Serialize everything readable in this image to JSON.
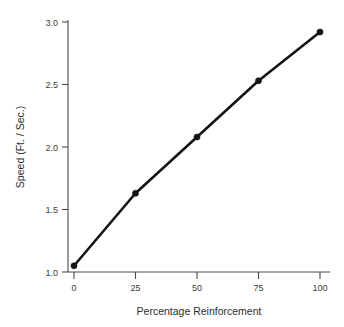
{
  "chart_data": {
    "type": "line",
    "title": "",
    "xlabel": "Percentage Reinforcement",
    "ylabel": "Speed (Ft. / Sec.)",
    "x": [
      0,
      25,
      50,
      75,
      100
    ],
    "values": [
      1.05,
      1.63,
      2.08,
      2.53,
      2.92
    ],
    "series": [
      {
        "name": "Speed",
        "x": [
          0,
          25,
          50,
          75,
          100
        ],
        "values": [
          1.05,
          1.63,
          2.08,
          2.53,
          2.92
        ]
      }
    ],
    "xlim": [
      -4,
      104
    ],
    "ylim": [
      1.0,
      3.0
    ],
    "xticks": [
      0,
      25,
      50,
      75,
      100
    ],
    "xtick_labels": [
      "0",
      "25",
      "50",
      "75",
      "100"
    ],
    "yticks": [
      1.0,
      1.5,
      2.0,
      2.5,
      3.0
    ],
    "ytick_labels": [
      "1.0",
      "1.5",
      "2.0",
      "2.5",
      "3.0"
    ],
    "grid": false,
    "legend": null,
    "legend_position": "none",
    "marker": "filled-circle",
    "line_color": "#141414",
    "axis_color": "#4a4a4a",
    "tick_label_color": "#3b3b3b",
    "background_color": "#ffffff",
    "spines": [
      "left",
      "bottom"
    ]
  },
  "figure": {
    "caption_fragment": ""
  }
}
